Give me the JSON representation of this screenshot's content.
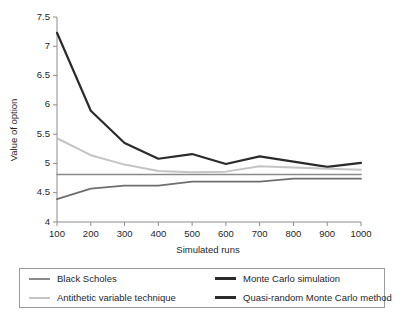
{
  "chart_data": {
    "type": "line",
    "title": "",
    "xlabel": "Simulated runs",
    "ylabel": "Value of option",
    "x": [
      100,
      200,
      300,
      400,
      500,
      600,
      700,
      800,
      900,
      1000
    ],
    "xtick_labels": [
      "100",
      "200",
      "300",
      "400",
      "500",
      "600",
      "700",
      "800",
      "900",
      "1000"
    ],
    "ytick_labels": [
      "4",
      "4.5",
      "5",
      "5.5",
      "6",
      "6.5",
      "7",
      "7.5"
    ],
    "yticks": [
      4,
      4.5,
      5,
      5.5,
      6,
      6.5,
      7,
      7.5
    ],
    "xlim": [
      100,
      1000
    ],
    "ylim": [
      4,
      7.5
    ],
    "grid": false,
    "legend_position": "below",
    "series": [
      {
        "name": "Black Scholes",
        "color": "#8a8a8a",
        "width": 1.6,
        "values": [
          4.81,
          4.81,
          4.81,
          4.81,
          4.81,
          4.81,
          4.81,
          4.81,
          4.81,
          4.81
        ]
      },
      {
        "name": "Monte Carlo simulation",
        "color": "#2b2b2b",
        "width": 2.2,
        "values": [
          7.23,
          5.9,
          5.35,
          5.08,
          5.16,
          4.99,
          5.12,
          5.03,
          4.94,
          5.01
        ]
      },
      {
        "name": "Antithetic variable technique",
        "color": "#c4c4c4",
        "width": 2.0,
        "values": [
          5.43,
          5.14,
          4.98,
          4.87,
          4.85,
          4.86,
          4.95,
          4.93,
          4.91,
          4.89
        ]
      },
      {
        "name": "Quasi-random Monte Carlo method",
        "color": "#6e6e6e",
        "width": 1.8,
        "values": [
          4.39,
          4.57,
          4.62,
          4.62,
          4.69,
          4.69,
          4.69,
          4.74,
          4.74,
          4.74
        ]
      }
    ]
  },
  "legend": {
    "entries": [
      {
        "label": "Black Scholes",
        "color": "#8a8a8a",
        "width": 2
      },
      {
        "label": "Monte Carlo simulation",
        "color": "#2b2b2b",
        "width": 3
      },
      {
        "label": "Antithetic variable technique",
        "color": "#c4c4c4",
        "width": 2
      },
      {
        "label": "Quasi-random Monte Carlo method",
        "color": "#2b2b2b",
        "width": 3
      }
    ]
  }
}
